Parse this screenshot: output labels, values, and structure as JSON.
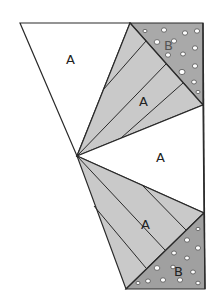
{
  "figure": {
    "width": 217,
    "height": 307,
    "colors": {
      "background": "#ffffff",
      "line": "#2a2a2a",
      "fan_fill": "#c9c9c9",
      "b_fill": "#a3a3a3",
      "dot_fill": "#ffffff"
    },
    "labels": {
      "triangle_top_left": "A",
      "fan_upper": "A",
      "triangle_middle_right": "A",
      "fan_lower": "A",
      "triangle_upper_b": "B",
      "triangle_lower_b": "B"
    },
    "vertices": {
      "top_left": [
        20,
        23
      ],
      "top_mid": [
        130,
        23
      ],
      "top_right": [
        203,
        23
      ],
      "apex": [
        77,
        156
      ],
      "right_upper": [
        203,
        105
      ],
      "right_lower": [
        204,
        213
      ],
      "bottom_left": [
        126,
        289
      ],
      "bottom_right": [
        205,
        289
      ]
    }
  }
}
